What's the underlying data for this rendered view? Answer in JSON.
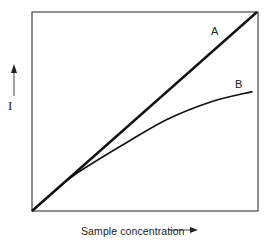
{
  "chart_data": {
    "type": "line",
    "title": "",
    "xlabel": "Sample concentration",
    "ylabel": "I",
    "xlim": [
      0,
      1
    ],
    "ylim": [
      0,
      1
    ],
    "grid": false,
    "legend": "inline labels at curve ends",
    "axis_ticks": "none",
    "series": [
      {
        "name": "A",
        "description": "linear response",
        "x": [
          0,
          1
        ],
        "y": [
          0,
          1
        ]
      },
      {
        "name": "B",
        "description": "curved (saturating) response",
        "x": [
          0,
          0.1,
          0.2,
          0.4,
          0.6,
          0.8,
          0.98
        ],
        "y": [
          0,
          0.1,
          0.19,
          0.33,
          0.46,
          0.55,
          0.6
        ]
      }
    ]
  },
  "labels": {
    "x_axis": "Sample concentration",
    "y_axis": "I",
    "curve_a": "A",
    "curve_b": "B"
  },
  "colors": {
    "line": "#111111",
    "frame": "#555555"
  }
}
